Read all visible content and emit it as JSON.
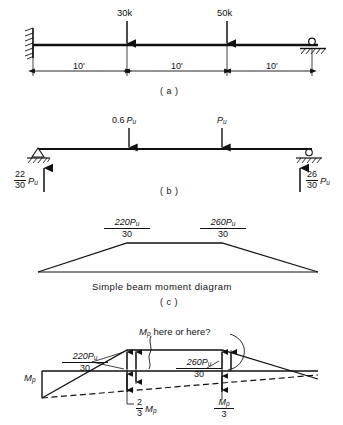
{
  "figure": {
    "panels": [
      {
        "id": "a",
        "panel_label": "( a )",
        "description": "Propped cantilever beam with fixed left support and roller right support carrying two concentrated loads",
        "loads": [
          {
            "label": "30k",
            "value": 30,
            "unit": "k",
            "position_ft": 10
          },
          {
            "label": "50k",
            "value": 50,
            "unit": "k",
            "position_ft": 20
          }
        ],
        "dimensions": [
          {
            "label": "10'",
            "value": 10,
            "unit": "ft"
          },
          {
            "label": "10'",
            "value": 10,
            "unit": "ft"
          },
          {
            "label": "10'",
            "value": 10,
            "unit": "ft"
          }
        ],
        "supports": [
          {
            "type": "fixed-wall",
            "side": "left"
          },
          {
            "type": "roller",
            "side": "right"
          }
        ]
      },
      {
        "id": "b",
        "panel_label": "( b )",
        "description": "Simply supported beam with factored loads and end reactions",
        "loads": [
          {
            "coefficient": "0.6",
            "symbol": "P",
            "subscript": "u",
            "position_ft": 10
          },
          {
            "coefficient": "",
            "symbol": "P",
            "subscript": "u",
            "position_ft": 20
          }
        ],
        "reactions": [
          {
            "side": "left",
            "numerator": "22",
            "denominator": "30",
            "symbol": "P",
            "subscript": "u"
          },
          {
            "side": "right",
            "numerator": "26",
            "denominator": "30",
            "symbol": "P",
            "subscript": "u"
          }
        ],
        "supports": [
          {
            "type": "pin",
            "side": "left"
          },
          {
            "type": "roller",
            "side": "right"
          }
        ]
      },
      {
        "id": "c",
        "panel_label": "( c )",
        "caption": "Simple beam moment diagram",
        "description": "Trapezoidal simple-beam moment diagram",
        "ordinates": [
          {
            "numerator": "220P",
            "num_subscript": "u",
            "denominator": "30",
            "position_ft": 10
          },
          {
            "numerator": "260P",
            "num_subscript": "u",
            "denominator": "30",
            "position_ft": 20
          }
        ]
      },
      {
        "id": "d",
        "panel_label": "",
        "description": "Combined moment diagram showing plastic hinge locations",
        "annotation": "here or here?",
        "annotation_symbol": "M",
        "annotation_subscript": "p",
        "ordinates": [
          {
            "numerator": "220P",
            "num_subscript": "u",
            "denominator": "30",
            "position_ft": 10
          },
          {
            "numerator": "260P",
            "num_subscript": "u",
            "denominator": "30",
            "position_ft": 20
          }
        ],
        "end_moment": {
          "symbol": "M",
          "subscript": "p",
          "side": "left"
        },
        "redundant_ordinates": [
          {
            "numerator": "2",
            "denominator": "3",
            "symbol": "M",
            "subscript": "p",
            "style": "leading-fraction",
            "position_ft": 10
          },
          {
            "numerator": "M",
            "num_subscript": "p",
            "denominator": "3",
            "style": "stacked-fraction",
            "position_ft": 20
          }
        ]
      }
    ]
  },
  "colors": {
    "ink": "#111111",
    "beam": "#111111",
    "paper": "#ffffff"
  }
}
